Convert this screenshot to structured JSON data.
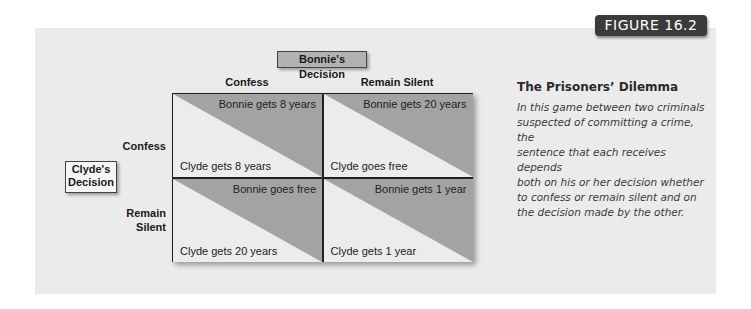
{
  "figure": {
    "tab_label": "FIGURE 16.2"
  },
  "game": {
    "column_player_label": "Bonnie's Decision",
    "row_player_label": "Clyde's Decision",
    "row_player_label_lines": [
      "Clyde's",
      "Decision"
    ],
    "columns": [
      "Confess",
      "Remain Silent"
    ],
    "rows": [
      "Confess",
      "Remain Silent"
    ],
    "row_label_lines": [
      [
        "Confess"
      ],
      [
        "Remain",
        "Silent"
      ]
    ],
    "cells": [
      [
        {
          "bonnie": "Bonnie gets 8 years",
          "clyde": "Clyde gets 8 years"
        },
        {
          "bonnie": "Bonnie gets 20 years",
          "clyde": "Clyde goes free"
        }
      ],
      [
        {
          "bonnie": "Bonnie goes free",
          "clyde": "Clyde gets 20 years"
        },
        {
          "bonnie": "Bonnie gets 1 year",
          "clyde": "Clyde gets 1 year"
        }
      ]
    ]
  },
  "caption": {
    "title": "The Prisoners’ Dilemma",
    "body_lines": [
      "In this game between two criminals",
      "suspected of committing a crime, the",
      "sentence that each receives depends",
      "both on his or her decision whether",
      "to confess or remain silent and on",
      "the decision made by the other."
    ]
  },
  "colors": {
    "panel_bg": "#ebebeb",
    "cell_light": "#ececec",
    "cell_dark": "#a3a3a3",
    "tab_bg": "#3b3b3b",
    "bonnie_box_bg": "#b2b2b2"
  }
}
